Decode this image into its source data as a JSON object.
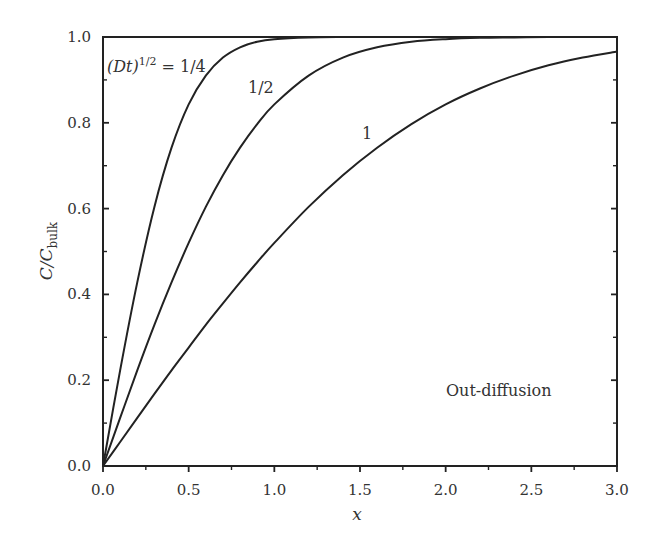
{
  "chart_data": {
    "type": "line",
    "title": "",
    "xlabel": "x",
    "ylabel": "C/C_bulk",
    "ylabel_main": "C/C",
    "ylabel_sub": "bulk",
    "xlim": [
      0.0,
      3.0
    ],
    "ylim": [
      0.0,
      1.0
    ],
    "grid": false,
    "legend": "none (inline curve labels)",
    "x_ticks": [
      "0.0",
      "0.5",
      "1.0",
      "1.5",
      "2.0",
      "2.5",
      "3.0"
    ],
    "x_tick_values": [
      0.0,
      0.5,
      1.0,
      1.5,
      2.0,
      2.5,
      3.0
    ],
    "x_minor_ticks": [
      0.25,
      0.75,
      1.25,
      1.75,
      2.25,
      2.75
    ],
    "y_ticks": [
      "0.0",
      "0.2",
      "0.4",
      "0.6",
      "0.8",
      "1.0"
    ],
    "y_tick_values": [
      0.0,
      0.2,
      0.4,
      0.6,
      0.8,
      1.0
    ],
    "y_minor_ticks": [
      0.1,
      0.3,
      0.5,
      0.7,
      0.9
    ],
    "x": [
      0.0,
      0.1,
      0.2,
      0.3,
      0.4,
      0.5,
      0.6,
      0.7,
      0.8,
      0.9,
      1.0,
      1.2,
      1.4,
      1.6,
      1.8,
      2.0,
      2.2,
      2.4,
      2.6,
      2.8,
      3.0
    ],
    "series": [
      {
        "name": "(Dt)^1/2 = 1/4",
        "values": [
          0.0,
          0.223,
          0.428,
          0.604,
          0.742,
          0.843,
          0.91,
          0.952,
          0.976,
          0.989,
          0.995,
          0.999,
          1.0,
          1.0,
          1.0,
          1.0,
          1.0,
          1.0,
          1.0,
          1.0,
          1.0
        ]
      },
      {
        "name": "1/2",
        "values": [
          0.0,
          0.112,
          0.223,
          0.329,
          0.428,
          0.52,
          0.604,
          0.678,
          0.742,
          0.797,
          0.843,
          0.91,
          0.952,
          0.976,
          0.989,
          0.995,
          0.998,
          0.999,
          1.0,
          1.0,
          1.0
        ]
      },
      {
        "name": "1",
        "values": [
          0.0,
          0.056,
          0.112,
          0.168,
          0.223,
          0.276,
          0.329,
          0.379,
          0.428,
          0.475,
          0.52,
          0.604,
          0.678,
          0.742,
          0.797,
          0.843,
          0.88,
          0.91,
          0.934,
          0.952,
          0.966
        ]
      }
    ],
    "annotations": [
      {
        "text": "(Dt)^1/2 = 1/4",
        "x": 0.02,
        "y": 0.93
      },
      {
        "text": "1/2",
        "x": 0.86,
        "y": 0.86
      },
      {
        "text": "1",
        "x": 1.55,
        "y": 0.73
      },
      {
        "text": "Out-diffusion",
        "x": 2.0,
        "y": 0.18
      }
    ]
  },
  "labels": {
    "curve_quarter_prefix": "(Dt)",
    "curve_quarter_sup": "1/2",
    "curve_quarter_suffix": " = 1/4",
    "curve_half": "1/2",
    "curve_one": "1",
    "region_note": "Out-diffusion",
    "x_axis": "x",
    "y_axis_main": "C/C",
    "y_axis_sub": "bulk"
  }
}
